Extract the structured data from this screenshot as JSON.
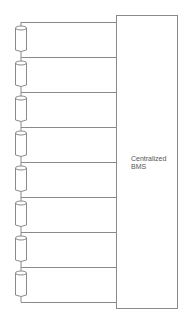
{
  "diagram": {
    "box": {
      "label_line1": "Centralized",
      "label_line2": "BMS"
    },
    "cells": {
      "count": 8
    },
    "colors": {
      "line": "#8a8a8a"
    }
  }
}
